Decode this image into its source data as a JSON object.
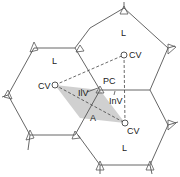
{
  "diagram": {
    "labels": {
      "lobule_top_left": "L",
      "lobule_top_right": "L",
      "lobule_bottom_right": "L",
      "central_vein_left": "CV",
      "central_vein_top_right": "CV",
      "central_vein_bottom_right": "CV",
      "portal_canal": "PC",
      "interlobular_vein": "IlV",
      "inlet_venule": "InV",
      "acinus": "A"
    },
    "colors": {
      "line": "#555555",
      "acinus_fill": "#c8c8c8",
      "background": "#ffffff"
    }
  }
}
